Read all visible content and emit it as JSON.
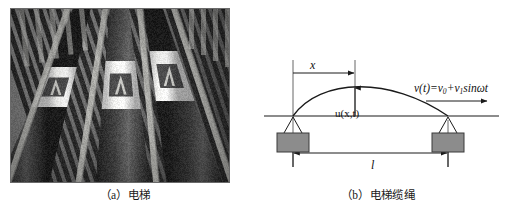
{
  "figure": {
    "panel_a": {
      "caption": "（a）电梯",
      "image_alt": "elevator-photo"
    },
    "panel_b": {
      "caption": "（b）电梯缆绳",
      "labels": {
        "x": "x",
        "l": "l",
        "u": "u(x,t)",
        "v_prefix": "v(t)=v",
        "v_sub0": "0",
        "v_mid": "+v",
        "v_sub1": "1",
        "v_suffix": "sinωt",
        "v_full": "v(t)=v0+v1sinωt"
      }
    }
  },
  "colors": {
    "line": "#1a1a1a",
    "block_fill": "#8c8c8c",
    "block_stroke": "#3a3a3a",
    "photo_bg": "#6d6d6d",
    "text": "#111111"
  }
}
